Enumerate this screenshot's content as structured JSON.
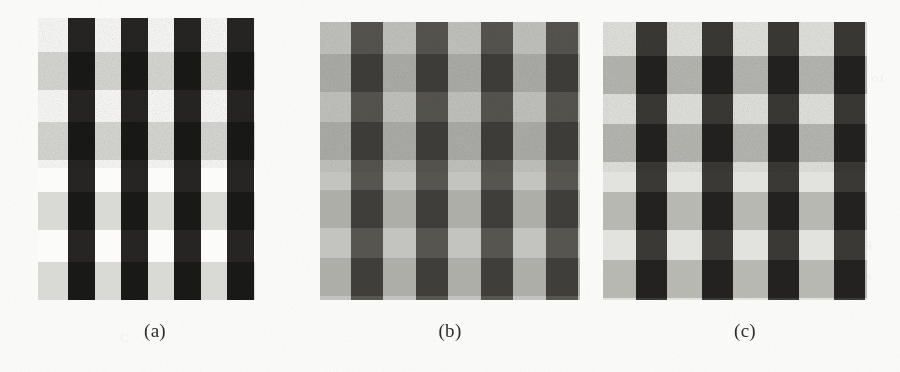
{
  "figure": {
    "kind": "scanned-figure",
    "background_color": "#fcfcfb",
    "panel_count": 3,
    "caption_font_size_px": 19,
    "caption_color": "#2e2e2c"
  },
  "panels": [
    {
      "id": "panel-a",
      "label": "(a)",
      "label_center_x": 155,
      "label_y": 320,
      "rect": {
        "x": 38,
        "y": 18,
        "w": 217,
        "h": 282
      },
      "description": "high-contrast plaid grid: near-black vertical bars over light-gray horizontal bands on white",
      "background_color": "#fbfbfa",
      "vertical_bar_color": "#262523",
      "horizontal_band_color": "#d9d9d6",
      "intersection_color": "#191917",
      "vertical_bars": [
        {
          "x": 30,
          "w": 27
        },
        {
          "x": 83,
          "w": 27
        },
        {
          "x": 136,
          "w": 27
        },
        {
          "x": 189,
          "w": 27
        }
      ],
      "horizontal_bands": [
        {
          "y": 34,
          "h": 38
        },
        {
          "y": 104,
          "h": 38
        },
        {
          "y": 174,
          "h": 38
        },
        {
          "y": 244,
          "h": 38
        }
      ],
      "contrast_level": "high"
    },
    {
      "id": "panel-b",
      "label": "(b)",
      "label_center_x": 450,
      "label_y": 320,
      "rect": {
        "x": 320,
        "y": 22,
        "w": 260,
        "h": 278
      },
      "description": "low-contrast plaid grid: medium-dark gray vertical bars on light-gray ground with faint horizontal bands",
      "background_color": "#c3c3bf",
      "vertical_bar_color": "#565550",
      "horizontal_band_color": "#aeaea9",
      "intersection_color": "#3f3e3a",
      "vertical_bars": [
        {
          "x": 31,
          "w": 32
        },
        {
          "x": 96,
          "w": 32
        },
        {
          "x": 161,
          "w": 32
        },
        {
          "x": 226,
          "w": 32
        }
      ],
      "horizontal_bands": [
        {
          "y": 32,
          "h": 38
        },
        {
          "y": 100,
          "h": 38
        },
        {
          "y": 168,
          "h": 38
        },
        {
          "y": 236,
          "h": 38
        }
      ],
      "contrast_level": "low"
    },
    {
      "id": "panel-c",
      "label": "(c)",
      "label_center_x": 745,
      "label_y": 320,
      "rect": {
        "x": 603,
        "y": 22,
        "w": 264,
        "h": 278
      },
      "description": "intermediate-contrast plaid grid: dark gray vertical bars over gray horizontal bands on light ground",
      "background_color": "#e2e2de",
      "vertical_bar_color": "#3a3935",
      "horizontal_band_color": "#b8b8b3",
      "intersection_color": "#232220",
      "vertical_bars": [
        {
          "x": 33,
          "w": 31
        },
        {
          "x": 99,
          "w": 31
        },
        {
          "x": 165,
          "w": 31
        },
        {
          "x": 231,
          "w": 31
        }
      ],
      "horizontal_bands": [
        {
          "y": 34,
          "h": 38
        },
        {
          "y": 102,
          "h": 38
        },
        {
          "y": 170,
          "h": 38
        },
        {
          "y": 238,
          "h": 38
        }
      ],
      "contrast_level": "medium"
    }
  ],
  "bleed_through_marks": [
    {
      "text": "of the image",
      "x": 150,
      "y": 100
    },
    {
      "text": "contrast",
      "x": 470,
      "y": 150
    },
    {
      "text": "C",
      "x": 120,
      "y": 330
    },
    {
      "text": "ng",
      "x": 858,
      "y": 235
    },
    {
      "text": "in",
      "x": 852,
      "y": 252
    },
    {
      "text": "ages",
      "x": 845,
      "y": 268
    },
    {
      "text": "of",
      "x": 872,
      "y": 70
    },
    {
      "text": "w",
      "x": 430,
      "y": 40
    }
  ]
}
